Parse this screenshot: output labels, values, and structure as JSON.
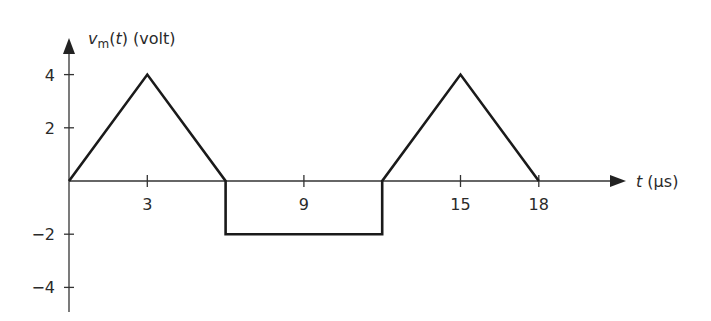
{
  "chart_data": {
    "type": "line",
    "title": "",
    "ylabel": "v_m(t) (volt)",
    "ylabel_parts": {
      "base": "v",
      "sub": "m",
      "rest_open": "(",
      "var": "t",
      "rest_close": ") (volt)"
    },
    "xlabel": "t (μs)",
    "xlabel_parts": {
      "var": "t",
      "unit": " (μs)"
    },
    "x_ticks": [
      3,
      9,
      15,
      18
    ],
    "x_tick_labels": [
      "3",
      "9",
      "15",
      "18"
    ],
    "y_ticks": [
      4,
      2,
      -2,
      -4
    ],
    "y_tick_labels": [
      "4",
      "2",
      "−2",
      "−4"
    ],
    "xlim": [
      0,
      21
    ],
    "ylim": [
      -4.5,
      4.8
    ],
    "grid": false,
    "legend": null,
    "series": [
      {
        "name": "v_m(t)",
        "x": [
          0,
          3,
          6,
          6,
          12,
          12,
          15,
          18
        ],
        "y": [
          0,
          4,
          0,
          -2,
          -2,
          0,
          4,
          0
        ]
      }
    ],
    "color": "#1a1a1a"
  }
}
